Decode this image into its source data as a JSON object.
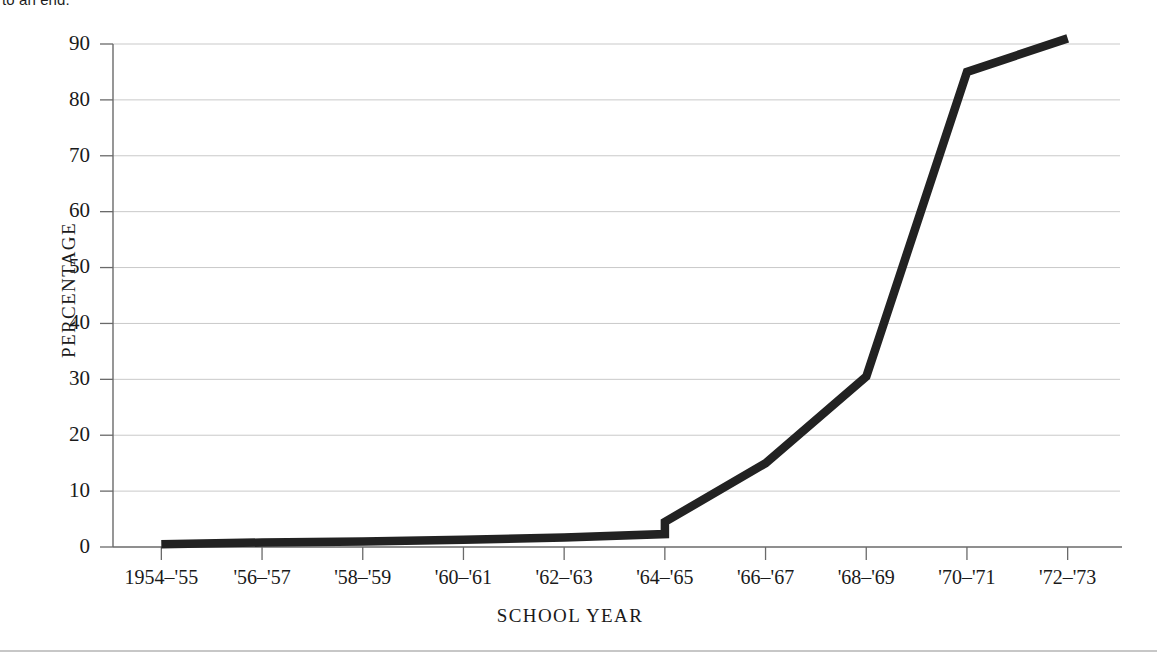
{
  "page": {
    "cropped_text_above_figure": "to an end."
  },
  "chart_data": {
    "type": "line",
    "title": "",
    "xlabel": "SCHOOL  YEAR",
    "ylabel": "PERCENTAGE",
    "categories": [
      "1954–'55",
      "'56–'57",
      "'58–'59",
      "'60–'61",
      "'62–'63",
      "'64–'65",
      "'66–'67",
      "'68–'69",
      "'70–'71",
      "'72–'73"
    ],
    "values": [
      0.5,
      0.8,
      1.0,
      1.3,
      1.7,
      4.5,
      15.0,
      30.5,
      85.0,
      91.0
    ],
    "value_at_break_low": 2.3,
    "ylim": [
      0,
      90
    ],
    "yticks": [
      0,
      10,
      20,
      30,
      40,
      50,
      60,
      70,
      80,
      90
    ],
    "ytick_labels": [
      "0",
      "10",
      "20",
      "30",
      "40",
      "50",
      "60",
      "70",
      "80",
      "90"
    ],
    "grid": "horizontal",
    "legend": "none",
    "series_color": "#222222",
    "gridline_color": "#c9c9c9",
    "axis_color": "#6a6a6a"
  }
}
